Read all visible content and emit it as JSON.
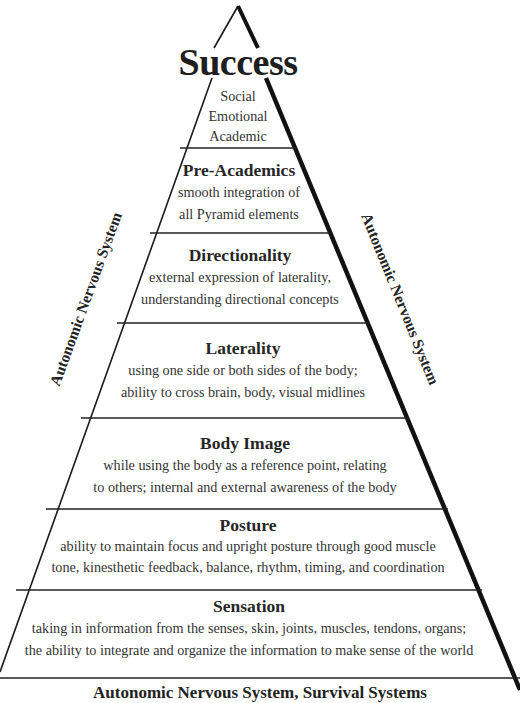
{
  "pyramid": {
    "title": "Success",
    "apex": {
      "lines": [
        "Social",
        "Emotional",
        "Academic"
      ]
    },
    "levels": [
      {
        "name": "Pre-Academics",
        "desc": [
          "smooth integration of",
          "all Pyramid elements"
        ]
      },
      {
        "name": "Directionality",
        "desc": [
          "external expression of laterality,",
          "understanding directional concepts"
        ]
      },
      {
        "name": "Laterality",
        "desc": [
          "using one side or both sides of the body;",
          "ability to cross brain, body, visual midlines"
        ]
      },
      {
        "name": "Body Image",
        "desc": [
          "while using the body as a reference point, relating",
          "to others; internal and external awareness of the body"
        ]
      },
      {
        "name": "Posture",
        "desc": [
          "ability to maintain focus and upright posture through good muscle",
          "tone, kinesthetic feedback, balance, rhythm, timing, and coordination"
        ]
      },
      {
        "name": "Sensation",
        "desc": [
          "taking in information from the senses, skin, joints, muscles, tendons, organs;",
          "the ability to integrate and organize the information to make sense of the world"
        ]
      }
    ],
    "left_side_label": "Autonomic Nervous System",
    "right_side_label": "Autonomic Nervous System",
    "base_label": "Autonomic Nervous System, Survival Systems"
  },
  "colors": {
    "line": "#1a1a1a",
    "text": "#2a2a2a",
    "background": "#ffffff"
  }
}
